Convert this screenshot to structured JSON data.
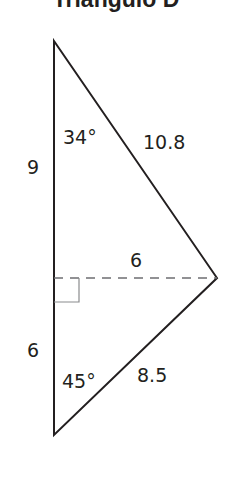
{
  "title": "Triángulo D",
  "diagram": {
    "type": "triangle",
    "vertices": {
      "top": [
        54,
        41
      ],
      "right": [
        217,
        278
      ],
      "bottom": [
        54,
        435
      ]
    },
    "altitude": {
      "from": [
        54,
        278
      ],
      "to": [
        217,
        278
      ],
      "style": "dashed"
    },
    "labels": {
      "left_upper_segment": "9",
      "left_lower_segment": "6",
      "top_angle": "34°",
      "upper_hypotenuse": "10.8",
      "altitude_length": "6",
      "bottom_angle": "45°",
      "lower_hypotenuse": "8.5"
    }
  },
  "colors": {
    "line": "#231f20",
    "dashed": "#6d6e71"
  }
}
